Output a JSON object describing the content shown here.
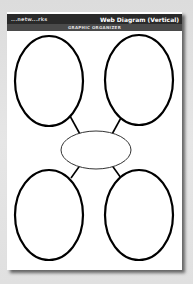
{
  "header": {
    "brand": "...netw...rks",
    "title": "Web Diagram (Vertical)",
    "subtitle": "GRAPHIC ORGANIZER"
  },
  "diagram": {
    "type": "web-diagram-vertical",
    "center_node": {
      "label": "",
      "shape": "ellipse"
    },
    "outer_nodes": [
      {
        "position": "top-left",
        "label": ""
      },
      {
        "position": "top-right",
        "label": ""
      },
      {
        "position": "bottom-left",
        "label": ""
      },
      {
        "position": "bottom-right",
        "label": ""
      }
    ]
  },
  "colors": {
    "header_bg": "#2a2a2a",
    "subbar_bg": "#4a4a4a",
    "stroke": "#000000",
    "page": "#ffffff"
  }
}
